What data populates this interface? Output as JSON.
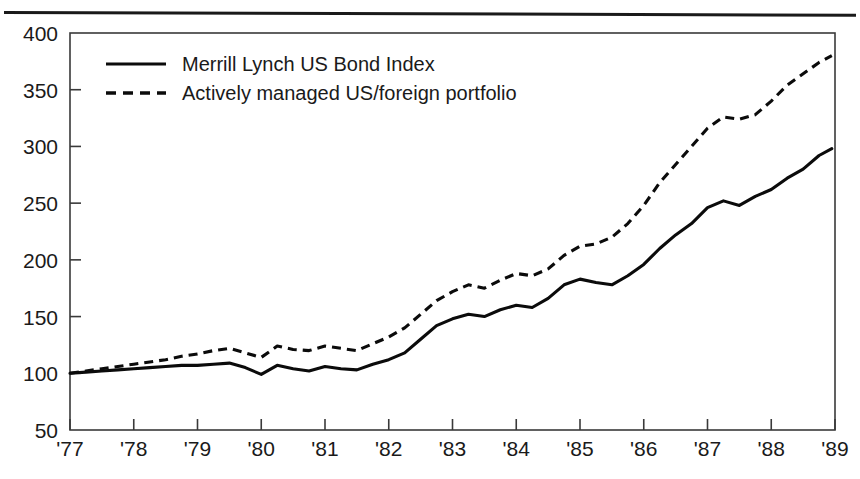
{
  "figure": {
    "divider_rule": "horizontal-rule",
    "background_color": "#ffffff",
    "ink_color": "#0b0b0b"
  },
  "chart_data": {
    "type": "line",
    "title": "",
    "subtitle": "",
    "xlabel": "",
    "ylabel": "",
    "xlim": [
      1977.0,
      1989.0
    ],
    "ylim": [
      50,
      400
    ],
    "grid": false,
    "legend_position": "top-left-inside",
    "y_ticks": [
      50,
      100,
      150,
      200,
      250,
      300,
      350,
      400
    ],
    "y_tick_labels": [
      "50",
      "100",
      "150",
      "200",
      "250",
      "300",
      "350",
      "400"
    ],
    "x_ticks": [
      1977,
      1978,
      1979,
      1980,
      1981,
      1982,
      1983,
      1984,
      1985,
      1986,
      1987,
      1988,
      1989
    ],
    "x_tick_labels": [
      "'77",
      "'78",
      "'79",
      "'80",
      "'81",
      "'82",
      "'83",
      "'84",
      "'85",
      "'86",
      "'87",
      "'88",
      "'89"
    ],
    "x": [
      1977.0,
      1977.25,
      1977.5,
      1977.75,
      1978.0,
      1978.25,
      1978.5,
      1978.75,
      1979.0,
      1979.25,
      1979.5,
      1979.75,
      1980.0,
      1980.25,
      1980.5,
      1980.75,
      1981.0,
      1981.25,
      1981.5,
      1981.75,
      1982.0,
      1982.25,
      1982.5,
      1982.75,
      1983.0,
      1983.25,
      1983.5,
      1983.75,
      1984.0,
      1984.25,
      1984.5,
      1984.75,
      1985.0,
      1985.25,
      1985.5,
      1985.75,
      1986.0,
      1986.25,
      1986.5,
      1986.75,
      1987.0,
      1987.25,
      1987.5,
      1987.75,
      1988.0,
      1988.25,
      1988.5,
      1988.75,
      1988.95
    ],
    "series": [
      {
        "name": "Merrill Lynch US Bond Index",
        "style": "solid",
        "values": [
          100,
          101,
          102,
          103,
          104,
          105,
          106,
          107,
          107,
          108,
          109,
          105,
          99,
          107,
          104,
          102,
          106,
          104,
          103,
          108,
          112,
          118,
          130,
          142,
          148,
          152,
          150,
          156,
          160,
          158,
          166,
          178,
          183,
          180,
          178,
          186,
          196,
          210,
          222,
          232,
          246,
          252,
          248,
          256,
          262,
          272,
          280,
          292,
          298
        ]
      },
      {
        "name": "Actively managed US/foreign portfolio",
        "style": "dashed",
        "values": [
          100,
          102,
          104,
          106,
          108,
          110,
          112,
          115,
          117,
          120,
          122,
          118,
          114,
          124,
          121,
          120,
          124,
          122,
          120,
          126,
          132,
          140,
          152,
          164,
          172,
          178,
          175,
          182,
          188,
          186,
          192,
          204,
          212,
          214,
          220,
          232,
          248,
          268,
          284,
          300,
          316,
          326,
          324,
          328,
          340,
          354,
          364,
          374,
          380
        ]
      }
    ],
    "final_values": {
      "Merrill Lynch US Bond Index": 298,
      "Actively managed US/foreign portfolio": 380
    },
    "start_value": 100
  },
  "legend": {
    "items": [
      {
        "label": "Merrill Lynch US Bond Index",
        "style": "solid"
      },
      {
        "label": "Actively managed US/foreign portfolio",
        "style": "dashed"
      }
    ]
  }
}
